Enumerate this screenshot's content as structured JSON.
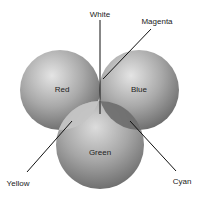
{
  "diagram": {
    "spheres": [
      {
        "id": "red",
        "label": "Red",
        "cx": 60,
        "cy": 90,
        "r": 40
      },
      {
        "id": "blue",
        "label": "Blue",
        "cx": 139,
        "cy": 90,
        "r": 40
      },
      {
        "id": "green",
        "label": "Green",
        "cx": 100,
        "cy": 145,
        "r": 44
      }
    ],
    "callouts": [
      {
        "id": "white",
        "label": "White"
      },
      {
        "id": "magenta",
        "label": "Magenta"
      },
      {
        "id": "yellow",
        "label": "Yellow"
      },
      {
        "id": "cyan",
        "label": "Cyan"
      }
    ],
    "colors": {
      "sphere_light": "#e6e6e6",
      "sphere_mid": "#a8a8a8",
      "sphere_dark": "#6a6a6a",
      "line": "#111111"
    }
  }
}
